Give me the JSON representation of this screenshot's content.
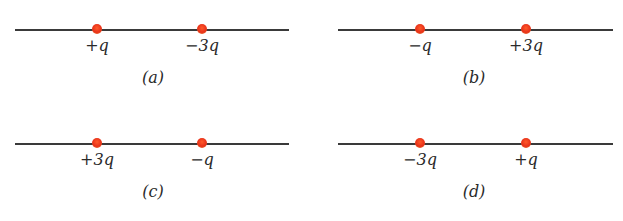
{
  "figure": {
    "accent_colors": {
      "charge_dot": "#e8321a",
      "axis_line": "#3a3a3a"
    },
    "panels": [
      {
        "id": "a",
        "caption": "(a)",
        "charges": [
          {
            "label": "+q"
          },
          {
            "label": "−3q"
          }
        ]
      },
      {
        "id": "b",
        "caption": "(b)",
        "charges": [
          {
            "label": "−q"
          },
          {
            "label": "+3q"
          }
        ]
      },
      {
        "id": "c",
        "caption": "(c)",
        "charges": [
          {
            "label": "+3q"
          },
          {
            "label": "−q"
          }
        ]
      },
      {
        "id": "d",
        "caption": "(d)",
        "charges": [
          {
            "label": "−3q"
          },
          {
            "label": "+q"
          }
        ]
      }
    ]
  }
}
